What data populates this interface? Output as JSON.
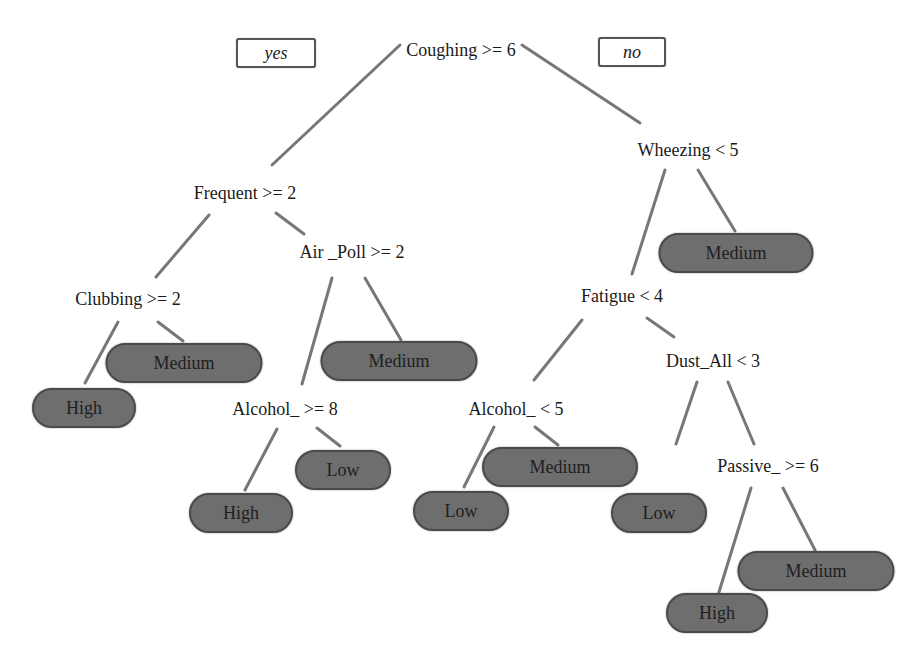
{
  "legend": {
    "yes": "yes",
    "no": "no"
  },
  "colors": {
    "leaf_fill": "#6e6e6e",
    "leaf_border": "#4a4a4a",
    "edge": "#777777",
    "background": "#ffffff"
  },
  "tree": {
    "root": "Coughing >= 6",
    "splits": {
      "frequent": "Frequent >= 2",
      "clubbing": "Clubbing >= 2",
      "air_poll": "Air _Poll >= 2",
      "alcohol_ge8": "Alcohol_ >= 8",
      "wheezing": "Wheezing < 5",
      "fatigue": "Fatigue < 4",
      "alcohol_lt5": "Alcohol_ < 5",
      "dust_all": "Dust_All < 3",
      "passive": "Passive_ >= 6"
    },
    "leaves": {
      "clubbing_high": "High",
      "clubbing_medium": "Medium",
      "air_poll_medium": "Medium",
      "alcohol_ge8_high": "High",
      "alcohol_ge8_low": "Low",
      "wheezing_medium": "Medium",
      "alcohol_lt5_low": "Low",
      "alcohol_lt5_medium": "Medium",
      "dust_all_low": "Low",
      "passive_high": "High",
      "passive_medium": "Medium"
    }
  }
}
